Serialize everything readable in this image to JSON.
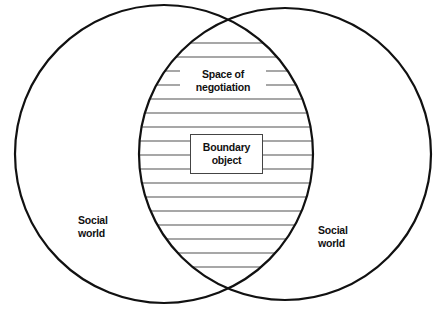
{
  "diagram": {
    "type": "venn",
    "sets": [
      {
        "id": "left",
        "label_lines": [
          "Social",
          "world"
        ]
      },
      {
        "id": "right",
        "label_lines": [
          "Social",
          "world"
        ]
      }
    ],
    "intersection": {
      "fill": "horizontal-hatch",
      "label_lines": [
        "Space of",
        "negotiation"
      ],
      "center_box": {
        "label_lines": [
          "Boundary",
          "object"
        ]
      }
    },
    "colors": {
      "stroke": "#111111",
      "hatch": "#8a8a8a",
      "background": "#ffffff"
    }
  }
}
